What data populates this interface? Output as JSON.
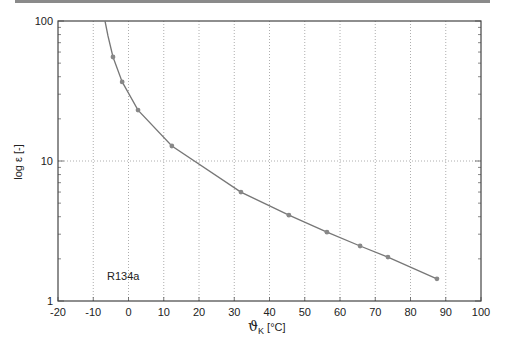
{
  "chart_data": {
    "type": "line",
    "title": "",
    "xlabel": "ϑK [°C]",
    "ylabel": "log ε [-]",
    "xlim": [
      -20,
      100
    ],
    "ylim": [
      1,
      100
    ],
    "yscale": "log",
    "grid": true,
    "x_ticks": [
      "-20",
      "-10",
      "0",
      "10",
      "20",
      "30",
      "40",
      "50",
      "60",
      "70",
      "80",
      "90",
      "100"
    ],
    "y_ticks": [
      "1",
      "10",
      "100"
    ],
    "annotation": "R134a",
    "series": [
      {
        "name": "R134a",
        "x": [
          -4.4,
          -1.8,
          2.7,
          12.3,
          31.9,
          45.5,
          56.3,
          65.7,
          73.6,
          87.5
        ],
        "y": [
          55.3,
          36.7,
          23.1,
          12.8,
          6.0,
          4.1,
          3.1,
          2.47,
          2.06,
          1.44
        ]
      }
    ],
    "curve_color": "#777777",
    "marker_color": "#888888"
  },
  "labels": {
    "xlabel_main": "ϑ",
    "xlabel_sub": "K",
    "xlabel_unit": " [°C]",
    "ylabel": "log ε [-]",
    "annotation": "R134a",
    "y_tick_1": "1",
    "y_tick_10": "10",
    "y_tick_100": "100"
  }
}
